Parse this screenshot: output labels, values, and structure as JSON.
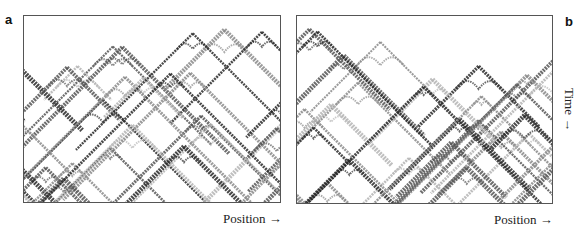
{
  "figure": {
    "panels": [
      {
        "id": "a",
        "label": "a",
        "x_axis_label": "Position →",
        "description": "Space-time diagram of a one-dimensional cellular automaton showing interacting triangular (Sierpinski-like) structures",
        "tone": [
          "#2a2a2a",
          "#555555",
          "#8a8a8a",
          "#b5b5b5"
        ]
      },
      {
        "id": "b",
        "label": "b",
        "x_axis_label": "Position →",
        "y_axis_label": "Time →",
        "description": "Space-time diagram of a one-dimensional cellular automaton showing interacting triangular (Sierpinski-like) structures",
        "tone": [
          "#2a2a2a",
          "#555555",
          "#8a8a8a",
          "#b5b5b5"
        ]
      }
    ]
  }
}
